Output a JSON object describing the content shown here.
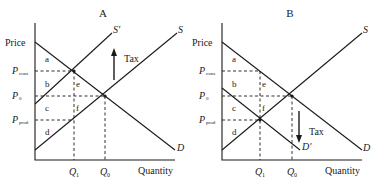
{
  "panels": [
    {
      "title": "A",
      "y_label": "Price",
      "x_label": "Quantity",
      "price_labels": {
        "p_cons_main": "P",
        "p_cons_sub": "cons",
        "p0_main": "P",
        "p0_sub": "0",
        "p_prod_main": "P",
        "p_prod_sub": "prod"
      },
      "quantity_labels": {
        "q1_main": "Q",
        "q1_sub": "1",
        "q0_main": "Q",
        "q0_sub": "0"
      },
      "areas": [
        "a",
        "b",
        "c",
        "d",
        "e",
        "f"
      ],
      "curves": {
        "supply": "S",
        "shifted_supply": "S'",
        "demand": "D"
      },
      "tax_label": "Tax",
      "tax_arrow_direction": "up"
    },
    {
      "title": "B",
      "y_label": "Price",
      "x_label": "Quantity",
      "price_labels": {
        "p_cons_main": "P",
        "p_cons_sub": "cons",
        "p0_main": "P",
        "p0_sub": "0",
        "p_prod_main": "P",
        "p_prod_sub": "prod"
      },
      "quantity_labels": {
        "q1_main": "Q",
        "q1_sub": "1",
        "q0_main": "Q",
        "q0_sub": "0"
      },
      "areas": [
        "a",
        "b",
        "c",
        "d",
        "e",
        "f"
      ],
      "curves": {
        "supply": "S",
        "demand": "D",
        "shifted_demand": "D'"
      },
      "tax_label": "Tax",
      "tax_arrow_direction": "down"
    }
  ]
}
